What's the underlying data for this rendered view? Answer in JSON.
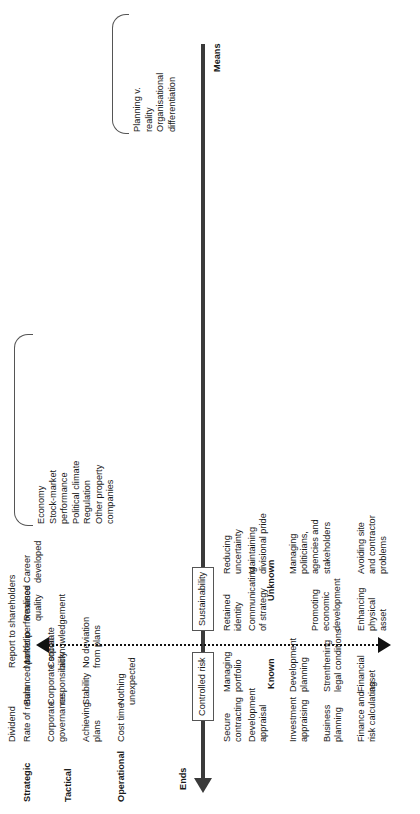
{
  "figure": {
    "axis": {
      "ends_label": "Ends",
      "means_label": "Means"
    },
    "row_headers": [
      {
        "label": "Strategic"
      },
      {
        "label": "Tactical"
      },
      {
        "label": "Operational"
      }
    ],
    "zone_labels": {
      "known": "Known",
      "unknown": "Unknown"
    },
    "axis_boxes": [
      {
        "label": "Controlled risk"
      },
      {
        "label": "Sustainability"
      }
    ],
    "top_headers": [
      {
        "label": "Dividend"
      },
      {
        "label": "Report to shareholders"
      }
    ],
    "columns": {
      "c1": [
        "Rate of return",
        "Corporate\ngovernance",
        "Achieving\nplans",
        "Cost time"
      ],
      "c2": [
        "Balanced portfolio",
        "Corporate social\nresponsibility",
        "Stability",
        "Nothing\nunexpected"
      ],
      "c3": [
        "Market performance",
        "Corporate\nacknowledgement",
        "No deviation\nfrom plans"
      ],
      "c4": [
        "Realised\nquality"
      ],
      "c5": [
        "Career\ndeveloped"
      ],
      "c6": [
        "Secure\ncontracting",
        "Development\nappraisal",
        "Investment\nappraising",
        "Business\nplanning",
        "Finance and\nrisk calculating"
      ],
      "c7": [
        "Managing\nportfolio",
        "Development\nplanning",
        "Strenthening\nlegal conditions",
        "Financial\nasset"
      ],
      "c8": [
        "Retained\nidentity",
        "Communicating\nof strategy",
        "Promoting\neconomic\ndevelopment",
        "Enhancing\nphysical\nasset"
      ],
      "c9": [
        "Reducing\nuncertainty",
        "Maintaining\ndivisional pride",
        "Managing\npoliticians,\nagencies and\nstakeholders",
        "Avoiding site\nand contractor\nproblems"
      ]
    },
    "brackets": {
      "external_factors": "Economy\nStock-market\nperformance\nPolitical climate\nRegulation\nOther property\ncompanies",
      "internal_tensions": "Planning v.\nreality\nOrganisational\ndifferentiation"
    }
  }
}
